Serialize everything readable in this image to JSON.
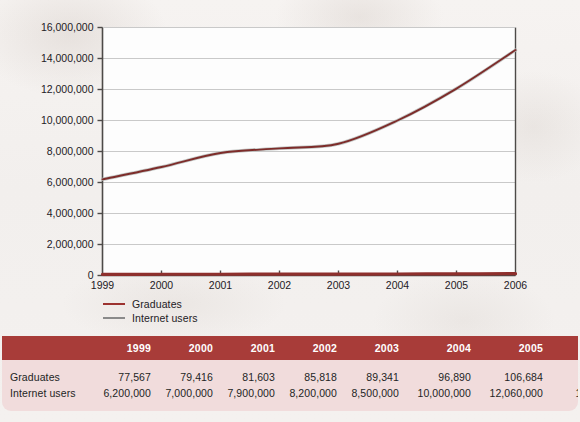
{
  "chart_data": {
    "type": "line",
    "title": "",
    "subtitle": "",
    "xlabel": "",
    "ylabel": "",
    "categories": [
      "1999",
      "2000",
      "2001",
      "2002",
      "2003",
      "2004",
      "2005",
      "2006"
    ],
    "x": [
      1999,
      2000,
      2001,
      2002,
      2003,
      2004,
      2005,
      2006
    ],
    "ylim": [
      0,
      16000000
    ],
    "xlim": [
      1999,
      2006
    ],
    "grid": true,
    "legend_position": "bottom-left",
    "y_ticks": [
      0,
      2000000,
      4000000,
      6000000,
      8000000,
      10000000,
      12000000,
      14000000,
      16000000
    ],
    "y_tick_labels": [
      "0",
      "2,000,000",
      "4,000,000",
      "6,000,000",
      "8,000,000",
      "10,000,000",
      "12,000,000",
      "14,000,000",
      "16,000,000"
    ],
    "x_tick_labels": [
      "1999",
      "2000",
      "2001",
      "2002",
      "2003",
      "2004",
      "2005",
      "2006"
    ],
    "series": [
      {
        "name": "Graduates",
        "color": "#9c3330",
        "values": [
          77567,
          79416,
          81603,
          85818,
          89341,
          96890,
          106684,
          117392
        ],
        "value_labels": [
          "77,567",
          "79,416",
          "81,603",
          "85,818",
          "89,341",
          "96,890",
          "106,684",
          "117,392"
        ]
      },
      {
        "name": "Internet users",
        "color": "#8a8a8a",
        "values": [
          6200000,
          7000000,
          7900000,
          8200000,
          8500000,
          10000000,
          12060000,
          14544360
        ],
        "value_labels": [
          "6,200,000",
          "7,000,000",
          "7,900,000",
          "8,200,000",
          "8,500,000",
          "10,000,000",
          "12,060,000",
          "14,544,360"
        ]
      }
    ]
  },
  "legend": {
    "items": [
      {
        "label": "Graduates",
        "color": "#9c3330"
      },
      {
        "label": "Internet users",
        "color": "#8a8a8a"
      }
    ]
  },
  "table": {
    "corner_header": "",
    "column_headers": [
      "1999",
      "2000",
      "2001",
      "2002",
      "2003",
      "2004",
      "2005",
      "2006"
    ],
    "rows": [
      {
        "label": "Graduates",
        "values": [
          "77,567",
          "79,416",
          "81,603",
          "85,818",
          "89,341",
          "96,890",
          "106,684",
          "117,392"
        ]
      },
      {
        "label": "Internet users",
        "values": [
          "6,200,000",
          "7,000,000",
          "7,900,000",
          "8,200,000",
          "8,500,000",
          "10,000,000",
          "12,060,000",
          "14,544,360"
        ]
      }
    ]
  },
  "colors": {
    "header_background": "#a83c39",
    "table_background": "#f1dcdc",
    "page_background": "#f3f0ee",
    "graduates_line": "#9c3330",
    "internet_line": "#8a8a8a",
    "axis": "#4d4a48",
    "gridline": "#c9c9c9"
  }
}
